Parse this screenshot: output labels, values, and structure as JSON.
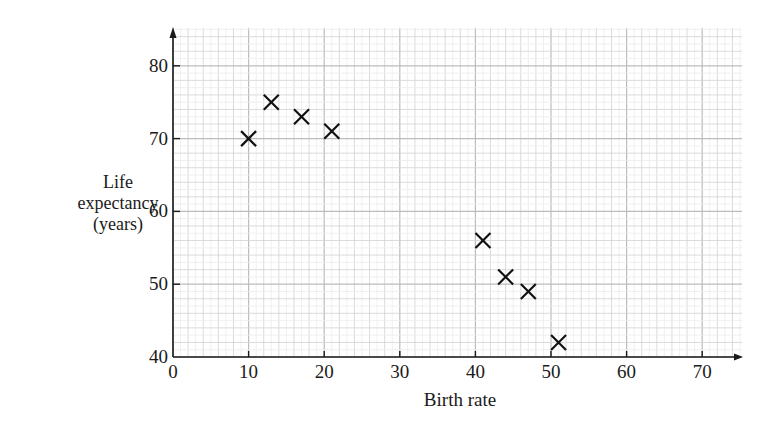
{
  "chart_data": {
    "type": "scatter",
    "title": "",
    "xlabel": "Birth rate",
    "ylabel": "Life expectancy (years)",
    "ylabel_lines": [
      "Life",
      "expectancy",
      "(years)"
    ],
    "xlim": [
      0,
      75
    ],
    "ylim": [
      40,
      85
    ],
    "xticks": [
      0,
      10,
      20,
      30,
      40,
      50,
      60,
      70
    ],
    "yticks": [
      40,
      50,
      60,
      70,
      80
    ],
    "grid": true,
    "grid_style": "graph paper: major every 10, minor every 2",
    "marker": "x",
    "legend": null,
    "points": [
      {
        "x": 10,
        "y": 70
      },
      {
        "x": 13,
        "y": 75
      },
      {
        "x": 17,
        "y": 73
      },
      {
        "x": 21,
        "y": 71
      },
      {
        "x": 41,
        "y": 56
      },
      {
        "x": 44,
        "y": 51
      },
      {
        "x": 47,
        "y": 49
      },
      {
        "x": 51,
        "y": 42
      }
    ]
  },
  "colors": {
    "axis": "#1a1a1a",
    "grid_major": "#bcbcbc",
    "grid_minor": "#dedede",
    "marker": "#111111"
  }
}
